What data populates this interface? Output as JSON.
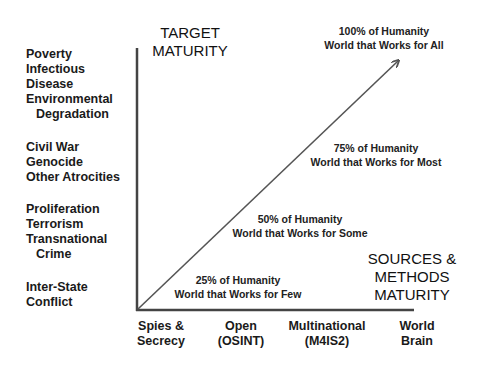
{
  "y_axis": {
    "title_lines": [
      "TARGET",
      "MATURITY"
    ],
    "groups": [
      {
        "lines": [
          "Poverty",
          "Infectious",
          "Disease",
          "Environmental",
          "Degradation"
        ]
      },
      {
        "lines": [
          "Civil War",
          "Genocide",
          "Other Atrocities"
        ]
      },
      {
        "lines": [
          "Proliferation",
          "Terrorism",
          "Transnational",
          "Crime"
        ]
      },
      {
        "lines": [
          "Inter-State",
          "Conflict"
        ]
      }
    ]
  },
  "x_axis": {
    "title_lines": [
      "SOURCES &",
      "METHODS",
      "MATURITY"
    ],
    "ticks": [
      {
        "lines": [
          "Spies &",
          "Secrecy"
        ]
      },
      {
        "lines": [
          "Open",
          "(OSINT)"
        ]
      },
      {
        "lines": [
          "Multinational",
          "(M4IS2)"
        ]
      },
      {
        "lines": [
          "World",
          "Brain"
        ]
      }
    ]
  },
  "milestones": [
    {
      "pct": "25% of Humanity",
      "desc": "World that Works for Few"
    },
    {
      "pct": "50% of Humanity",
      "desc": "World that Works for Some"
    },
    {
      "pct": "75% of Humanity",
      "desc": "World that Works for Most"
    },
    {
      "pct": "100% of Humanity",
      "desc": "World that Works for All"
    }
  ],
  "colors": {
    "axis": "#444444",
    "arrow": "#555555"
  }
}
